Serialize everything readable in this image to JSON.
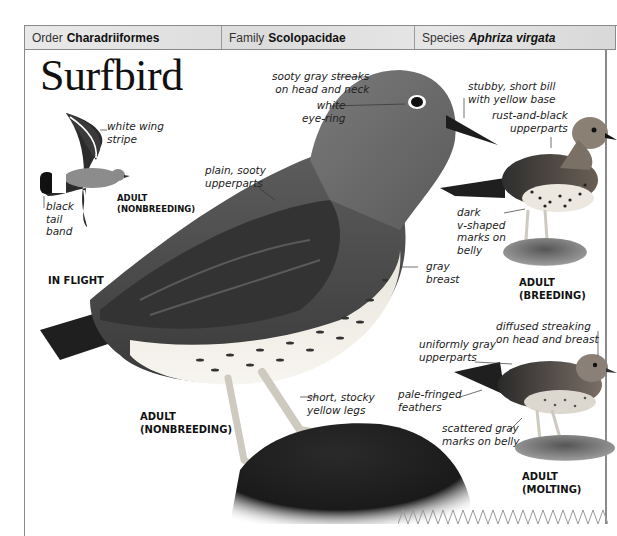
{
  "taxonomy": {
    "order": {
      "label": "Order",
      "value": "Charadriiformes"
    },
    "family": {
      "label": "Family",
      "value": "Scolopacidae"
    },
    "species": {
      "label": "Species",
      "value": "Aphriza virgata"
    }
  },
  "title": "Surfbird",
  "in_flight": {
    "caption": "IN FLIGHT",
    "age_label_line1": "ADULT",
    "age_label_line2": "(NONBREEDING)",
    "notes": {
      "wing_stripe_1": "white wing",
      "wing_stripe_2": "stripe",
      "tail_band_1": "black",
      "tail_band_2": "tail",
      "tail_band_3": "band"
    }
  },
  "main_bird": {
    "caption_line1": "ADULT",
    "caption_line2": "(NONBREEDING)",
    "notes": {
      "streaks_1": "sooty gray streaks",
      "streaks_2": "on head and neck",
      "eyering_1": "white",
      "eyering_2": "eye-ring",
      "upperparts_1": "plain, sooty",
      "upperparts_2": "upperparts",
      "breast_1": "gray",
      "breast_2": "breast",
      "legs_1": "short, stocky",
      "legs_2": "yellow legs",
      "bill_1": "stubby, short bill",
      "bill_2": "with yellow base"
    }
  },
  "breeding_bird": {
    "caption_line1": "ADULT",
    "caption_line2": "(BREEDING)",
    "notes": {
      "upperparts_1": "rust-and-black",
      "upperparts_2": "upperparts",
      "belly_1": "dark",
      "belly_2": "v-shaped",
      "belly_3": "marks on",
      "belly_4": "belly"
    }
  },
  "molting_bird": {
    "caption_line1": "ADULT",
    "caption_line2": "(MOLTING)",
    "notes": {
      "streaking_1": "diffused streaking",
      "streaking_2": "on head and breast",
      "upperparts_1": "uniformly gray",
      "upperparts_2": "upperparts",
      "feathers_1": "pale-fringed",
      "feathers_2": "feathers",
      "belly_1": "scattered gray",
      "belly_2": "marks on belly"
    }
  },
  "colors": {
    "frame": "#8a8a8a",
    "header_bg": "#e0e0e0",
    "text": "#111111",
    "bird_dark": "#3a3a3a",
    "bird_mid": "#6e6e6e",
    "bird_light": "#f2f0ea",
    "leg": "#cfcac0",
    "rock": "#1e1e1e"
  }
}
